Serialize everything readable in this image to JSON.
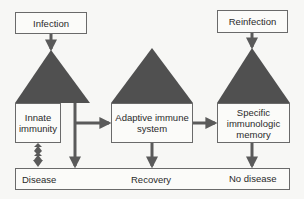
{
  "diagram": {
    "colors": {
      "triangle": "#505050",
      "arrow": "#5a5a5a",
      "box_border": "#6a6a6a",
      "background": "#f7f7f5"
    },
    "triggers": {
      "infection": "Infection",
      "reinfection": "Reinfection"
    },
    "stages": [
      {
        "label": "Innate\nimmunity"
      },
      {
        "label": "Adaptive immune\nsystem"
      },
      {
        "label": "Specific\nimmunologic\nmemory"
      }
    ],
    "outcomes": {
      "disease": "Disease",
      "recovery": "Recovery",
      "no_disease": "No disease"
    }
  }
}
